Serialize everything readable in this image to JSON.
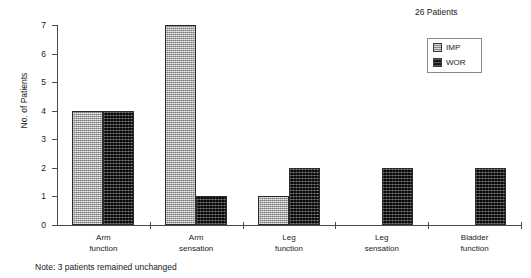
{
  "chart_data": {
    "type": "bar",
    "title": "",
    "subtitle": "",
    "xlabel": "",
    "ylabel": "No. of Patients",
    "ylim": [
      0,
      7
    ],
    "yticks": [
      0,
      1,
      2,
      3,
      4,
      5,
      6,
      7
    ],
    "ytick_labels": [
      "0",
      "1",
      "2",
      "3",
      "4",
      "5",
      "6",
      "7"
    ],
    "grid": false,
    "legend_position": "top-right",
    "categories": [
      "Arm function",
      "Arm sensation",
      "Leg function",
      "Leg sensation",
      "Bladder function"
    ],
    "category_lines": [
      [
        "Arm",
        "function"
      ],
      [
        "Arm",
        "sensation"
      ],
      [
        "Leg",
        "function"
      ],
      [
        "Leg",
        "sensation"
      ],
      [
        "Bladder",
        "function"
      ]
    ],
    "series": [
      {
        "name": "IMP",
        "color": "#a6a6a6",
        "values": [
          4,
          7,
          1,
          0,
          0
        ]
      },
      {
        "name": "WOR",
        "color": "#2e2e2e",
        "values": [
          4,
          1,
          2,
          2,
          2
        ]
      }
    ],
    "annotations": [
      "26 Patients",
      "Note: 3 patients remained unchanged"
    ]
  },
  "legend": {
    "count_label": "26 Patients",
    "entries": [
      {
        "label": "IMP",
        "swatch": "imp"
      },
      {
        "label": "WOR",
        "swatch": "wor"
      }
    ]
  },
  "footnote": {
    "text": "Note: 3 patients remained unchanged"
  }
}
